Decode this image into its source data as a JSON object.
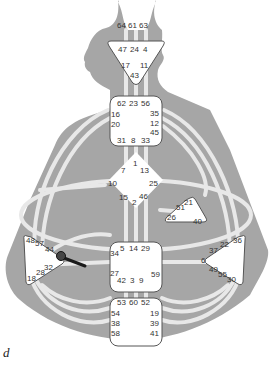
{
  "diagram": {
    "type": "human-design-bodygraph",
    "colors": {
      "body": "#a6a6a6",
      "channel": "#e8e8e8",
      "center_fill": "#ffffff",
      "center_stroke": "#555555",
      "activation": "#1a1a1a"
    },
    "centers": {
      "head": {
        "gates": [
          "64",
          "61",
          "63"
        ]
      },
      "ajna": {
        "gates": [
          "47",
          "24",
          "4",
          "17",
          "11",
          "43"
        ]
      },
      "throat": {
        "gates": [
          "62",
          "23",
          "56",
          "16",
          "35",
          "20",
          "12",
          "45",
          "31",
          "8",
          "33"
        ]
      },
      "g": {
        "gates": [
          "1",
          "7",
          "13",
          "10",
          "25",
          "15",
          "2",
          "46"
        ]
      },
      "ego": {
        "gates": [
          "21",
          "51",
          "26",
          "40"
        ]
      },
      "spleen": {
        "gates": [
          "48",
          "57",
          "44",
          "32",
          "28",
          "18"
        ]
      },
      "sacral": {
        "gates": [
          "5",
          "14",
          "29",
          "34",
          "27",
          "59",
          "42",
          "3",
          "9"
        ]
      },
      "solar_plexus": {
        "gates": [
          "36",
          "22",
          "37",
          "6",
          "49",
          "55",
          "30"
        ]
      },
      "root": {
        "gates": [
          "53",
          "60",
          "52",
          "54",
          "19",
          "38",
          "39",
          "58",
          "41"
        ]
      }
    },
    "activated_channel": {
      "from_gate": "44",
      "description": "dark partial channel line from spleen"
    },
    "caption": "d"
  }
}
